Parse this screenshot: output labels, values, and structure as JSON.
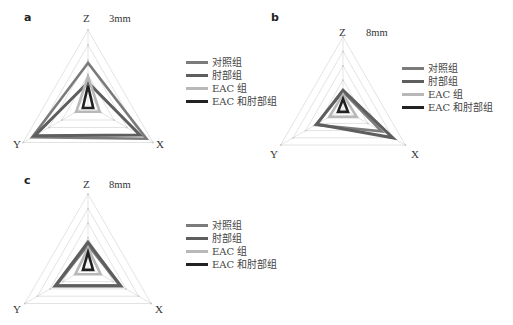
{
  "figure": {
    "axes": [
      "Z",
      "Y",
      "X"
    ],
    "legend": [
      {
        "label": "对照组",
        "color": "#7b7b7b",
        "width": 2.6
      },
      {
        "label": "肘部组",
        "color": "#5e5e5e",
        "width": 3.0
      },
      {
        "label": "EAC 组",
        "color": "#b8b8b8",
        "width": 2.6
      },
      {
        "label": "EAC 和肘部组",
        "color": "#222222",
        "width": 2.6
      }
    ],
    "panels": [
      {
        "letter": "a",
        "distance": "3mm"
      },
      {
        "letter": "b",
        "distance": "8mm"
      },
      {
        "letter": "c",
        "distance": "8mm"
      }
    ]
  },
  "chart_data": [
    {
      "type": "radar",
      "title": "a — 3mm",
      "axes": [
        "Z",
        "Y",
        "X"
      ],
      "range": [
        0,
        5
      ],
      "grid_levels": 5,
      "series": [
        {
          "name": "对照组",
          "values": [
            2.8,
            4.3,
            4.5
          ]
        },
        {
          "name": "肘部组",
          "values": [
            1.5,
            4.1,
            4.0
          ]
        },
        {
          "name": "EAC 组",
          "values": [
            1.9,
            0.9,
            0.9
          ]
        },
        {
          "name": "EAC 和肘部组",
          "values": [
            1.3,
            0.4,
            0.4
          ]
        }
      ],
      "legend_position": "right"
    },
    {
      "type": "radar",
      "title": "b — 8mm",
      "axes": [
        "Z",
        "Y",
        "X"
      ],
      "range": [
        0,
        5
      ],
      "grid_levels": 5,
      "series": [
        {
          "name": "对照组",
          "values": [
            1.2,
            2.2,
            3.1
          ]
        },
        {
          "name": "肘部组",
          "values": [
            1.3,
            2.1,
            4.0
          ]
        },
        {
          "name": "EAC 组",
          "values": [
            1.0,
            1.1,
            1.1
          ]
        },
        {
          "name": "EAC 和肘部组",
          "values": [
            0.7,
            0.4,
            0.4
          ]
        }
      ],
      "legend_position": "right"
    },
    {
      "type": "radar",
      "title": "c — 8mm",
      "axes": [
        "Z",
        "Y",
        "X"
      ],
      "range": [
        0,
        5
      ],
      "grid_levels": 5,
      "series": [
        {
          "name": "对照组",
          "values": [
            1.5,
            2.5,
            2.5
          ]
        },
        {
          "name": "肘部组",
          "values": [
            1.7,
            2.6,
            2.6
          ]
        },
        {
          "name": "EAC 组",
          "values": [
            1.3,
            1.0,
            1.0
          ]
        },
        {
          "name": "EAC 和肘部组",
          "values": [
            1.0,
            0.4,
            0.4
          ]
        }
      ],
      "legend_position": "right"
    }
  ]
}
